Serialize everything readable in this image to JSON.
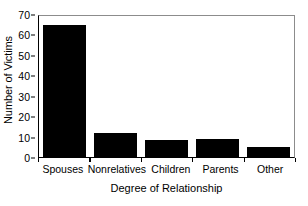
{
  "chart_data": {
    "type": "bar",
    "title": "",
    "xlabel": "Degree of Relationship",
    "ylabel": "Number of Victims",
    "categories": [
      "Spouses",
      "Nonrelatives",
      "Children",
      "Parents",
      "Other"
    ],
    "values": [
      65,
      12,
      8.5,
      9,
      5
    ],
    "ylim": [
      0,
      70
    ],
    "ytick_labels": [
      "0",
      "10",
      "20",
      "30",
      "40",
      "50",
      "60",
      "70"
    ],
    "ytick_values": [
      0,
      10,
      20,
      30,
      40,
      50,
      60,
      70
    ],
    "grid": false,
    "legend": null,
    "bar_color": "#000000",
    "background_color": "#ffffff",
    "axis_color": "#000000"
  }
}
